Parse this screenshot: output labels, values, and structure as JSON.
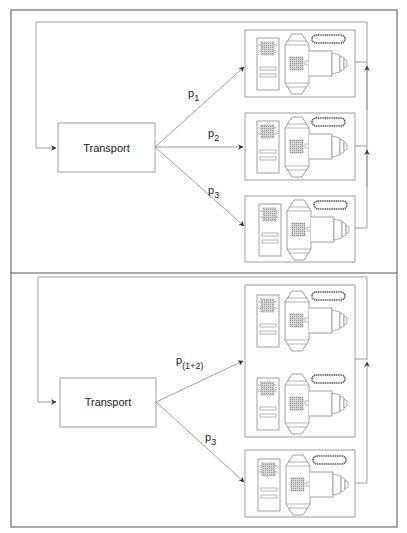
{
  "panels": [
    {
      "id": "top",
      "transport_label": "Transport",
      "flows": [
        {
          "label": "p",
          "subscript": "1"
        },
        {
          "label": "p",
          "subscript": "2"
        },
        {
          "label": "p",
          "subscript": "3"
        }
      ],
      "machine_count": 3
    },
    {
      "id": "bottom",
      "transport_label": "Transport",
      "flows": [
        {
          "label": "p",
          "subscript": "(1+2)"
        },
        {
          "label": "p",
          "subscript": "3"
        }
      ],
      "machine_count": 3
    }
  ],
  "colors": {
    "line": "#888888",
    "frame": "#555555",
    "hatch": "#bbbbbb",
    "background": "#ffffff"
  }
}
